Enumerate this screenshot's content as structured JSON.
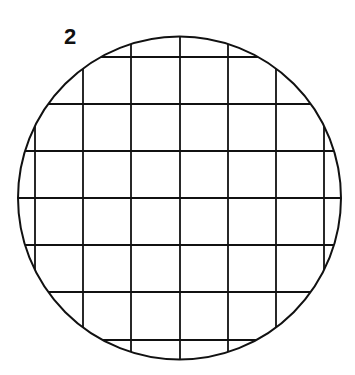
{
  "figure": {
    "label": "2",
    "circle": {
      "cx": 179.5,
      "cy": 198,
      "r": 161.5
    },
    "grid": {
      "vertical_x": [
        35,
        83,
        131,
        180,
        228,
        276,
        324
      ],
      "horizontal_y": [
        57,
        104,
        151,
        198,
        245,
        292,
        340
      ]
    },
    "stroke_color": "#111111"
  }
}
